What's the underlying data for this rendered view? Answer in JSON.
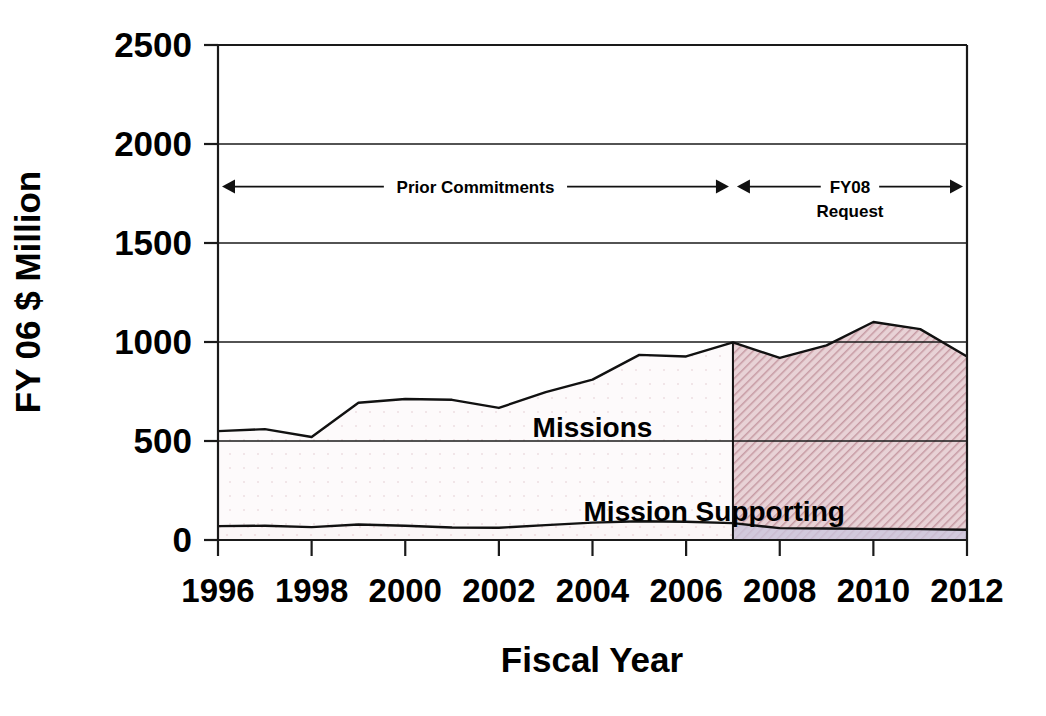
{
  "chart_data": {
    "type": "area",
    "title": "",
    "xlabel": "Fiscal Year",
    "ylabel": "FY 06 $ Million",
    "xlim": [
      1996,
      2012
    ],
    "ylim": [
      0,
      2500
    ],
    "xticks": [
      1996,
      1998,
      2000,
      2002,
      2004,
      2006,
      2008,
      2010,
      2012
    ],
    "xtick_labels": [
      "1996",
      "1998",
      "2000",
      "2002",
      "2004",
      "2006",
      "2008",
      "2010",
      "2012"
    ],
    "yticks": [
      0,
      500,
      1000,
      1500,
      2000,
      2500
    ],
    "ytick_labels": [
      "0",
      "500",
      "1000",
      "1500",
      "2000",
      "2500"
    ],
    "grid": true,
    "stacked": true,
    "x": [
      1996,
      1997,
      1998,
      1999,
      2000,
      2001,
      2002,
      2003,
      2004,
      2005,
      2006,
      2007,
      2008,
      2009,
      2010,
      2011,
      2012
    ],
    "series": [
      {
        "name": "Mission Supporting",
        "label": "Mission Supporting",
        "values": [
          70,
          72,
          65,
          78,
          72,
          63,
          62,
          75,
          88,
          95,
          92,
          85,
          60,
          58,
          56,
          55,
          52
        ],
        "fill_color": "#f7eef0",
        "line_color": "#111111"
      },
      {
        "name": "Missions",
        "label": "Missions",
        "values": [
          480,
          488,
          455,
          615,
          640,
          645,
          605,
          672,
          722,
          840,
          835,
          913,
          860,
          925,
          1045,
          1010,
          875
        ],
        "fill_color": "#f9f3f4",
        "line_color": "#111111"
      }
    ],
    "totals": [
      550,
      560,
      520,
      693,
      712,
      708,
      667,
      747,
      810,
      935,
      927,
      998,
      920,
      983,
      1101,
      1065,
      927
    ],
    "regions": [
      {
        "name": "prior-commitments",
        "label": "Prior Commitments",
        "x_start": 1996,
        "x_end": 2007,
        "fill_color": "#f9f3f4",
        "hatch": "dots"
      },
      {
        "name": "fy08-request",
        "label": "FY08",
        "label_line2": "Request",
        "x_start": 2007,
        "x_end": 2012,
        "fill_color": "#dab8bf",
        "hatch": "diagonal"
      }
    ],
    "annotations": [
      {
        "name": "prior-commitments-span",
        "text": "Prior Commitments",
        "y_value": 1785,
        "x_start": 1996,
        "x_end": 2007,
        "arrow": "both"
      },
      {
        "name": "fy08-request-span",
        "text": "FY08",
        "text_line2": "Request",
        "y_value": 1785,
        "x_start": 2007,
        "x_end": 2012,
        "arrow": "both"
      }
    ],
    "series_labels": [
      {
        "name": "missions-label",
        "text": "Missions",
        "x_value": 2004.0,
        "y_value": 520
      },
      {
        "name": "mission-supporting-label",
        "text": "Mission Supporting",
        "x_value": 2006.6,
        "y_value": 95
      }
    ],
    "colors": {
      "axis": "#1a1a1a",
      "text": "#000000",
      "prior_fill": "#f9f3f4",
      "request_fill": "#dab8bf",
      "line": "#111111"
    }
  }
}
